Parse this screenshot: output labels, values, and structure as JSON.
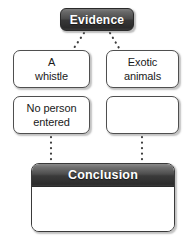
{
  "diagram": {
    "type": "graphic-organizer",
    "background_color": "#ffffff",
    "header": {
      "label": "Evidence",
      "fill_color": "#3a3a3a",
      "text_color": "#ffffff"
    },
    "evidence_boxes": [
      {
        "id": "whistle",
        "line1": "A",
        "line2": "whistle",
        "filled": true,
        "column": "left",
        "row": 1
      },
      {
        "id": "exotic",
        "line1": "Exotic",
        "line2": "animals",
        "filled": true,
        "column": "right",
        "row": 1
      },
      {
        "id": "noperson",
        "line1": "No person",
        "line2": "entered",
        "filled": true,
        "column": "left",
        "row": 2
      },
      {
        "id": "blank",
        "line1": "",
        "line2": "",
        "filled": false,
        "column": "right",
        "row": 2
      }
    ],
    "conclusion": {
      "label": "Conclusion",
      "header_fill_color": "#3a3a3a",
      "text_color": "#ffffff",
      "body_text": "",
      "body_filled": false
    },
    "connectors": [
      {
        "id": "evidence-to-whistle",
        "from": "Evidence",
        "to": "A whistle",
        "style": "dotted"
      },
      {
        "id": "evidence-to-exotic",
        "from": "Evidence",
        "to": "Exotic animals",
        "style": "dotted"
      },
      {
        "id": "noperson-to-conclusion",
        "from": "No person entered",
        "to": "Conclusion",
        "style": "dotted"
      },
      {
        "id": "blank-to-conclusion",
        "from": "blank box",
        "to": "Conclusion",
        "style": "dotted"
      }
    ]
  }
}
